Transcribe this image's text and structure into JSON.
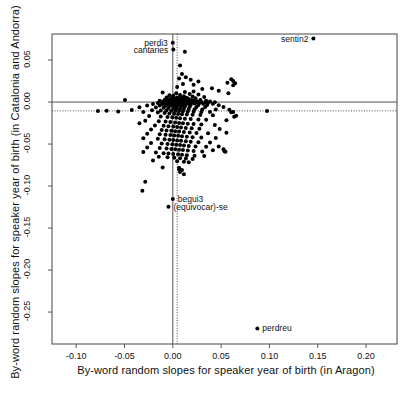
{
  "chart_data": {
    "type": "scatter",
    "title": "",
    "xlabel": "By-word random slopes for speaker year of birth (in Aragon)",
    "ylabel": "By-word random slopes for speaker year of birth (in Catalonia and Andorra)",
    "xlim": [
      -0.125,
      0.232
    ],
    "ylim": [
      -0.288,
      0.081
    ],
    "xticks": [
      -0.1,
      -0.05,
      0.0,
      0.05,
      0.1,
      0.15,
      0.2
    ],
    "xticklabels": [
      "-0.10",
      "-0.05",
      "0.00",
      "0.05",
      "0.10",
      "0.15",
      "0.20"
    ],
    "yticks": [
      0.05,
      0.0,
      -0.05,
      -0.1,
      -0.15,
      -0.2,
      -0.25
    ],
    "yticklabels": [
      "0.05",
      "0.00",
      "-0.05",
      "-0.10",
      "-0.15",
      "-0.20",
      "-0.25"
    ],
    "grid": false,
    "legend": null,
    "point_color": "#000000",
    "point_size": 2.0,
    "reference_lines": [
      {
        "orientation": "horizontal",
        "value": 0.0,
        "style": "solid",
        "color": "#555555"
      },
      {
        "orientation": "horizontal",
        "value": -0.0105,
        "style": "dotted",
        "color": "#333333"
      },
      {
        "orientation": "vertical",
        "value": 0.0,
        "style": "solid",
        "color": "#555555"
      },
      {
        "orientation": "vertical",
        "value": 0.0045,
        "style": "dotted",
        "color": "#333333"
      }
    ],
    "annotations": [
      {
        "label": "perdi3",
        "x": 0.0,
        "y": 0.0705,
        "side": "left"
      },
      {
        "label": "cantaries",
        "x": 0.0005,
        "y": 0.0625,
        "side": "left"
      },
      {
        "label": "sentin2",
        "x": 0.1455,
        "y": 0.0755,
        "side": "left"
      },
      {
        "label": "begui3",
        "x": 0.0,
        "y": -0.1155,
        "side": "right"
      },
      {
        "label": "(equivocar)-se",
        "x": -0.0045,
        "y": -0.1245,
        "side": "right"
      },
      {
        "label": "perdreu",
        "x": 0.0875,
        "y": -0.2695,
        "side": "right"
      }
    ],
    "points": [
      [
        0.1455,
        0.0755
      ],
      [
        0.0,
        0.0705
      ],
      [
        0.0005,
        0.0625
      ],
      [
        0.0125,
        0.06
      ],
      [
        0.0075,
        0.0435
      ],
      [
        0.0095,
        0.0335
      ],
      [
        0.0135,
        0.0295
      ],
      [
        0.0065,
        0.028
      ],
      [
        0.0185,
        0.0265
      ],
      [
        0.0265,
        0.0245
      ],
      [
        0.0605,
        0.027
      ],
      [
        0.0625,
        0.025
      ],
      [
        0.0565,
        0.023
      ],
      [
        0.0645,
        0.0225
      ],
      [
        0.0625,
        0.02
      ],
      [
        0.0215,
        0.0205
      ],
      [
        0.0105,
        0.0215
      ],
      [
        0.0045,
        0.018
      ],
      [
        0.0305,
        0.0155
      ],
      [
        0.0405,
        0.0165
      ],
      [
        0.0475,
        0.0135
      ],
      [
        0.0215,
        0.0125
      ],
      [
        0.0575,
        0.0105
      ],
      [
        0.0125,
        0.012
      ],
      [
        -0.0105,
        0.0115
      ],
      [
        0.0035,
        0.0105
      ],
      [
        0.0175,
        0.0095
      ],
      [
        0.0265,
        0.009
      ],
      [
        0.0075,
        0.0085
      ],
      [
        -0.0035,
        0.008
      ],
      [
        0.0005,
        0.0075
      ],
      [
        0.0115,
        0.007
      ],
      [
        0.0205,
        0.0065
      ],
      [
        0.0325,
        0.006
      ],
      [
        -0.0065,
        0.0055
      ],
      [
        0.0045,
        0.0055
      ],
      [
        0.0085,
        0.005
      ],
      [
        0.0145,
        0.005
      ],
      [
        0.0235,
        0.0045
      ],
      [
        -0.0015,
        0.0045
      ],
      [
        0.0025,
        0.0042
      ],
      [
        0.0065,
        0.004
      ],
      [
        0.0105,
        0.0038
      ],
      [
        0.0165,
        0.0035
      ],
      [
        0.0015,
        0.0035
      ],
      [
        -0.0045,
        0.0033
      ],
      [
        0.0035,
        0.003
      ],
      [
        0.0075,
        0.003
      ],
      [
        0.0125,
        0.0028
      ],
      [
        0.0195,
        0.0025
      ],
      [
        0.0285,
        0.0025
      ],
      [
        -0.0085,
        0.0025
      ],
      [
        -0.0025,
        0.0022
      ],
      [
        0.0005,
        0.0022
      ],
      [
        0.0045,
        0.002
      ],
      [
        0.0085,
        0.002
      ],
      [
        0.0145,
        0.0018
      ],
      [
        0.0225,
        0.0018
      ],
      [
        0.0345,
        0.0015
      ],
      [
        -0.0495,
        0.0025
      ],
      [
        -0.0135,
        0.0015
      ],
      [
        -0.0055,
        0.0013
      ],
      [
        0.0015,
        0.0013
      ],
      [
        0.0055,
        0.0012
      ],
      [
        0.0095,
        0.0012
      ],
      [
        0.0135,
        0.001
      ],
      [
        0.0185,
        0.001
      ],
      [
        0.0255,
        0.0008
      ],
      [
        0.0385,
        0.0008
      ],
      [
        -0.0095,
        0.0008
      ],
      [
        -0.0035,
        0.0007
      ],
      [
        0.0005,
        0.0007
      ],
      [
        0.0035,
        0.0005
      ],
      [
        0.0065,
        0.0005
      ],
      [
        0.0105,
        0.0005
      ],
      [
        0.0155,
        0.0003
      ],
      [
        0.0215,
        0.0003
      ],
      [
        0.0295,
        0.0002
      ],
      [
        -0.0065,
        0.0002
      ],
      [
        -0.0015,
        0.0
      ],
      [
        0.0025,
        0.0
      ],
      [
        0.0055,
        0.0
      ],
      [
        0.0085,
        0.0
      ],
      [
        0.0125,
        0.0
      ],
      [
        0.0175,
        -0.0002
      ],
      [
        0.0245,
        -0.0002
      ],
      [
        0.0335,
        -0.0003
      ],
      [
        0.0435,
        -0.0003
      ],
      [
        -0.0115,
        -0.0003
      ],
      [
        -0.0045,
        -0.0005
      ],
      [
        0.0005,
        -0.0005
      ],
      [
        0.0035,
        -0.0005
      ],
      [
        0.0065,
        -0.0007
      ],
      [
        0.0095,
        -0.0007
      ],
      [
        0.0145,
        -0.0008
      ],
      [
        0.0195,
        -0.0008
      ],
      [
        0.0275,
        -0.001
      ],
      [
        0.0365,
        -0.001
      ],
      [
        -0.0155,
        -0.001
      ],
      [
        -0.0075,
        -0.0012
      ],
      [
        -0.0025,
        -0.0013
      ],
      [
        0.0015,
        -0.0013
      ],
      [
        0.0045,
        -0.0015
      ],
      [
        0.0075,
        -0.0015
      ],
      [
        0.0115,
        -0.0017
      ],
      [
        0.0165,
        -0.0018
      ],
      [
        0.0225,
        -0.0018
      ],
      [
        0.0315,
        -0.002
      ],
      [
        0.0415,
        -0.002
      ],
      [
        -0.0205,
        -0.0022
      ],
      [
        -0.0105,
        -0.0022
      ],
      [
        -0.0055,
        -0.0025
      ],
      [
        -0.0005,
        -0.0025
      ],
      [
        0.0025,
        -0.0027
      ],
      [
        0.0055,
        -0.0028
      ],
      [
        0.0095,
        -0.003
      ],
      [
        0.0135,
        -0.003
      ],
      [
        0.0185,
        -0.0033
      ],
      [
        0.0265,
        -0.0035
      ],
      [
        0.0355,
        -0.0035
      ],
      [
        0.0475,
        -0.0038
      ],
      [
        -0.0265,
        -0.004
      ],
      [
        -0.0135,
        -0.0042
      ],
      [
        -0.0075,
        -0.0045
      ],
      [
        -0.0025,
        -0.0045
      ],
      [
        0.0015,
        -0.0047
      ],
      [
        0.0045,
        -0.0048
      ],
      [
        0.0085,
        -0.005
      ],
      [
        0.0125,
        -0.0052
      ],
      [
        0.0175,
        -0.0055
      ],
      [
        0.0245,
        -0.0058
      ],
      [
        0.0335,
        -0.006
      ],
      [
        0.0525,
        -0.0058
      ],
      [
        -0.0345,
        -0.0062
      ],
      [
        -0.0175,
        -0.0065
      ],
      [
        -0.0095,
        -0.0068
      ],
      [
        -0.0045,
        -0.007
      ],
      [
        0.0005,
        -0.0072
      ],
      [
        0.0035,
        -0.0075
      ],
      [
        0.0075,
        -0.0078
      ],
      [
        0.0115,
        -0.008
      ],
      [
        0.0165,
        -0.0082
      ],
      [
        0.0225,
        -0.0085
      ],
      [
        0.0305,
        -0.0088
      ],
      [
        0.0445,
        -0.009
      ],
      [
        0.0585,
        -0.0092
      ],
      [
        -0.0425,
        -0.0095
      ],
      [
        -0.0215,
        -0.0098
      ],
      [
        -0.0125,
        -0.01
      ],
      [
        -0.0065,
        -0.0102
      ],
      [
        -0.0015,
        -0.0105
      ],
      [
        0.0025,
        -0.0105
      ],
      [
        0.0065,
        -0.0108
      ],
      [
        0.0105,
        -0.011
      ],
      [
        0.0155,
        -0.0112
      ],
      [
        0.0215,
        -0.0115
      ],
      [
        0.0295,
        -0.0118
      ],
      [
        0.0385,
        -0.0118
      ],
      [
        0.0605,
        -0.012
      ],
      [
        0.0625,
        -0.0118
      ],
      [
        0.0975,
        -0.0108
      ],
      [
        -0.0565,
        -0.0112
      ],
      [
        -0.0685,
        -0.0105
      ],
      [
        -0.0775,
        -0.0108
      ],
      [
        -0.0305,
        -0.0118
      ],
      [
        -0.0155,
        -0.0125
      ],
      [
        -0.0085,
        -0.013
      ],
      [
        -0.0035,
        -0.0135
      ],
      [
        0.0015,
        -0.014
      ],
      [
        0.0055,
        -0.0142
      ],
      [
        0.0095,
        -0.0145
      ],
      [
        0.0145,
        -0.0148
      ],
      [
        0.0205,
        -0.0152
      ],
      [
        0.0285,
        -0.0155
      ],
      [
        0.0415,
        -0.0158
      ],
      [
        0.0655,
        -0.0162
      ],
      [
        0.0635,
        -0.0175
      ],
      [
        -0.0245,
        -0.0165
      ],
      [
        -0.0125,
        -0.0172
      ],
      [
        -0.0055,
        -0.0178
      ],
      [
        -0.0005,
        -0.0182
      ],
      [
        0.0035,
        -0.0188
      ],
      [
        0.0075,
        -0.0192
      ],
      [
        0.0125,
        -0.0198
      ],
      [
        0.0185,
        -0.0202
      ],
      [
        0.0265,
        -0.0208
      ],
      [
        0.0345,
        -0.0212
      ],
      [
        0.0555,
        -0.0218
      ],
      [
        -0.0285,
        -0.0222
      ],
      [
        -0.0145,
        -0.0228
      ],
      [
        -0.0075,
        -0.0232
      ],
      [
        -0.0025,
        -0.0238
      ],
      [
        0.0025,
        -0.0242
      ],
      [
        0.0065,
        -0.0248
      ],
      [
        0.0105,
        -0.0252
      ],
      [
        0.0155,
        -0.0258
      ],
      [
        0.0215,
        -0.0262
      ],
      [
        0.0295,
        -0.0268
      ],
      [
        0.0435,
        -0.0272
      ],
      [
        -0.0345,
        -0.0252
      ],
      [
        -0.0185,
        -0.0278
      ],
      [
        -0.0095,
        -0.0282
      ],
      [
        -0.0045,
        -0.0288
      ],
      [
        0.0005,
        -0.0292
      ],
      [
        0.0045,
        -0.0298
      ],
      [
        0.0085,
        -0.0302
      ],
      [
        0.0135,
        -0.0308
      ],
      [
        0.0195,
        -0.0312
      ],
      [
        0.0275,
        -0.0318
      ],
      [
        0.0485,
        -0.0322
      ],
      [
        -0.0225,
        -0.0328
      ],
      [
        -0.0115,
        -0.0332
      ],
      [
        -0.0065,
        -0.0338
      ],
      [
        -0.0015,
        -0.0342
      ],
      [
        0.0025,
        -0.0348
      ],
      [
        0.0065,
        -0.0352
      ],
      [
        0.0115,
        -0.0358
      ],
      [
        0.0175,
        -0.0362
      ],
      [
        0.0245,
        -0.0368
      ],
      [
        0.0365,
        -0.0372
      ],
      [
        0.0555,
        -0.0365
      ],
      [
        -0.0265,
        -0.0378
      ],
      [
        -0.0135,
        -0.0382
      ],
      [
        -0.0075,
        -0.0388
      ],
      [
        -0.0025,
        -0.0392
      ],
      [
        0.0015,
        -0.0398
      ],
      [
        0.0055,
        -0.0402
      ],
      [
        0.0095,
        -0.0408
      ],
      [
        0.0145,
        -0.0412
      ],
      [
        0.0205,
        -0.0418
      ],
      [
        0.0295,
        -0.0422
      ],
      [
        0.0445,
        -0.0428
      ],
      [
        -0.0305,
        -0.0432
      ],
      [
        -0.0155,
        -0.0438
      ],
      [
        -0.0085,
        -0.0442
      ],
      [
        -0.0035,
        -0.0448
      ],
      [
        0.0005,
        -0.0452
      ],
      [
        0.0045,
        -0.0458
      ],
      [
        0.0085,
        -0.0462
      ],
      [
        0.0135,
        -0.0468
      ],
      [
        0.0185,
        -0.0472
      ],
      [
        0.0265,
        -0.0478
      ],
      [
        0.0385,
        -0.0482
      ],
      [
        -0.0225,
        -0.0488
      ],
      [
        -0.0115,
        -0.0492
      ],
      [
        -0.0055,
        -0.0498
      ],
      [
        -0.0005,
        -0.0502
      ],
      [
        0.0035,
        -0.0508
      ],
      [
        0.0075,
        -0.0512
      ],
      [
        0.0115,
        -0.0518
      ],
      [
        0.0165,
        -0.0522
      ],
      [
        0.0235,
        -0.0528
      ],
      [
        0.0345,
        -0.0532
      ],
      [
        0.0475,
        -0.0528
      ],
      [
        -0.0265,
        -0.0542
      ],
      [
        -0.0135,
        -0.0548
      ],
      [
        -0.0065,
        -0.0552
      ],
      [
        -0.0015,
        -0.0558
      ],
      [
        0.0025,
        -0.0562
      ],
      [
        0.0065,
        -0.0568
      ],
      [
        0.0105,
        -0.0572
      ],
      [
        0.0155,
        -0.0578
      ],
      [
        0.0215,
        -0.0582
      ],
      [
        0.0305,
        -0.0588
      ],
      [
        0.0415,
        -0.0575
      ],
      [
        0.0525,
        -0.0562
      ],
      [
        0.0535,
        -0.0585
      ],
      [
        0.0545,
        -0.0592
      ],
      [
        -0.0305,
        -0.0595
      ],
      [
        -0.0175,
        -0.0602
      ],
      [
        -0.0095,
        -0.0608
      ],
      [
        -0.0045,
        -0.0612
      ],
      [
        0.0005,
        -0.0618
      ],
      [
        0.0055,
        -0.0622
      ],
      [
        0.0095,
        -0.0628
      ],
      [
        0.0145,
        -0.0632
      ],
      [
        0.0225,
        -0.0638
      ],
      [
        0.0325,
        -0.0642
      ],
      [
        -0.0145,
        -0.0652
      ],
      [
        -0.0055,
        -0.0658
      ],
      [
        0.0015,
        -0.0662
      ],
      [
        0.0075,
        -0.0668
      ],
      [
        0.0135,
        -0.0672
      ],
      [
        0.0205,
        -0.0678
      ],
      [
        -0.0205,
        -0.0695
      ],
      [
        0.0045,
        -0.0705
      ],
      [
        0.0115,
        -0.0712
      ],
      [
        0.0165,
        -0.0718
      ],
      [
        -0.0105,
        -0.0778
      ],
      [
        0.0065,
        -0.0782
      ],
      [
        0.0065,
        -0.0802
      ],
      [
        0.0095,
        -0.0808
      ],
      [
        0.0075,
        -0.0832
      ],
      [
        0.0115,
        -0.0858
      ],
      [
        -0.0285,
        -0.0948
      ],
      [
        -0.0315,
        -0.1055
      ],
      [
        0.0,
        -0.1155
      ],
      [
        -0.0045,
        -0.1245
      ],
      [
        0.0875,
        -0.2695
      ]
    ]
  }
}
